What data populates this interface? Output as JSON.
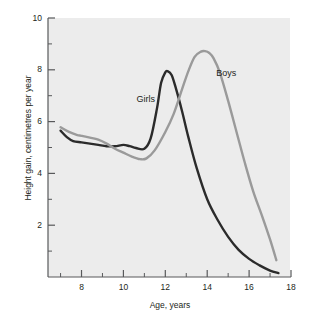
{
  "chart_data": {
    "type": "line",
    "title": "",
    "xlabel": "Age, years",
    "ylabel": "Height gain, centimetres per year",
    "xlim": [
      6.4,
      18
    ],
    "ylim": [
      0,
      10
    ],
    "grid": false,
    "legend_position": "inline-annotations",
    "x_ticks_major": [
      8,
      10,
      12,
      14,
      16,
      18
    ],
    "x_ticks_minor": [
      7,
      9,
      11,
      13,
      15,
      17
    ],
    "y_ticks_major": [
      2,
      4,
      6,
      8,
      10
    ],
    "y_ticks_minor": [
      1,
      3,
      5,
      7,
      9
    ],
    "x_tick_labels": [
      "8",
      "10",
      "12",
      "14",
      "16",
      "18"
    ],
    "y_tick_labels": [
      "2",
      "4",
      "6",
      "8",
      "10"
    ],
    "series": [
      {
        "name": "Girls",
        "color": "#2b2b2b",
        "label_x": 11.2,
        "label_y": 6.85,
        "x": [
          7.0,
          7.3,
          7.6,
          8.0,
          8.4,
          8.8,
          9.2,
          9.6,
          10.0,
          10.3,
          10.6,
          11.0,
          11.3,
          11.6,
          11.8,
          12.0,
          12.1,
          12.3,
          12.5,
          12.8,
          13.1,
          13.5,
          14.0,
          14.5,
          15.0,
          15.5,
          16.0,
          16.5,
          17.0,
          17.4
        ],
        "y": [
          5.65,
          5.4,
          5.25,
          5.2,
          5.15,
          5.1,
          5.05,
          5.05,
          5.1,
          5.05,
          4.98,
          4.95,
          5.35,
          6.5,
          7.5,
          7.9,
          7.95,
          7.8,
          7.3,
          6.4,
          5.4,
          4.2,
          3.0,
          2.2,
          1.55,
          1.05,
          0.7,
          0.45,
          0.25,
          0.15
        ]
      },
      {
        "name": "Boys",
        "color": "#9a9a9a",
        "label_x": 15.0,
        "label_y": 7.85,
        "x": [
          7.0,
          7.4,
          7.8,
          8.0,
          8.4,
          8.8,
          9.2,
          9.6,
          10.0,
          10.4,
          10.8,
          11.1,
          11.5,
          12.0,
          12.4,
          12.8,
          13.1,
          13.4,
          13.7,
          13.9,
          14.1,
          14.3,
          14.6,
          15.0,
          15.4,
          15.8,
          16.2,
          16.6,
          17.0,
          17.3
        ],
        "y": [
          5.78,
          5.6,
          5.48,
          5.45,
          5.38,
          5.3,
          5.15,
          4.95,
          4.8,
          4.65,
          4.55,
          4.58,
          4.9,
          5.6,
          6.3,
          7.25,
          7.95,
          8.5,
          8.7,
          8.72,
          8.65,
          8.45,
          7.9,
          6.8,
          5.6,
          4.4,
          3.3,
          2.4,
          1.45,
          0.65
        ]
      }
    ]
  }
}
